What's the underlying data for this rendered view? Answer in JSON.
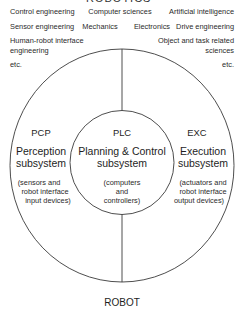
{
  "header": {
    "title": "ROBOTICS"
  },
  "disciplines": {
    "row1": [
      "Control engineering",
      "Computer sciences",
      "Artificial intelligence"
    ],
    "row2": [
      "Sensor engineering",
      "Mechanics",
      "Electronics",
      "Drive engineering"
    ],
    "left_extra": [
      "Human-robot interface",
      "engineering"
    ],
    "right_extra": [
      "Object and task related",
      "sciences"
    ],
    "etc_left": "etc.",
    "etc_right": "etc."
  },
  "subsystems": [
    {
      "id": "pcp",
      "abbr": "PCP",
      "name": [
        "Perception",
        "subsystem"
      ],
      "detail": [
        "(sensors and",
        "robot interface",
        "input devices)"
      ]
    },
    {
      "id": "plc",
      "abbr": "PLC",
      "name": [
        "Planning & Control",
        "subsystem"
      ],
      "detail": [
        "(computers",
        "and",
        "controllers)"
      ]
    },
    {
      "id": "exc",
      "abbr": "EXC",
      "name": [
        "Execution",
        "subsystem"
      ],
      "detail": [
        "(actuators and",
        "robot interface",
        "output devices)"
      ]
    }
  ],
  "footer": {
    "label": "ROBOT"
  },
  "colors": {
    "line": "#3a3a3a",
    "text": "#222222",
    "background": "#ffffff"
  }
}
